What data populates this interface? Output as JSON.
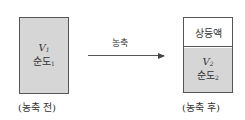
{
  "diagram": {
    "before": {
      "volume_symbol": "V",
      "volume_sub": "1",
      "purity_label": "순도",
      "purity_sub": "1",
      "caption": "(농축 전)",
      "fill_color": "#d6d6d6"
    },
    "process": {
      "label": "농축"
    },
    "after": {
      "supernatant_label": "상등액",
      "volume_symbol": "V",
      "volume_sub": "2",
      "purity_label": "순도",
      "purity_sub": "2",
      "caption": "(농축 후)",
      "fill_color": "#d6d6d6"
    }
  }
}
